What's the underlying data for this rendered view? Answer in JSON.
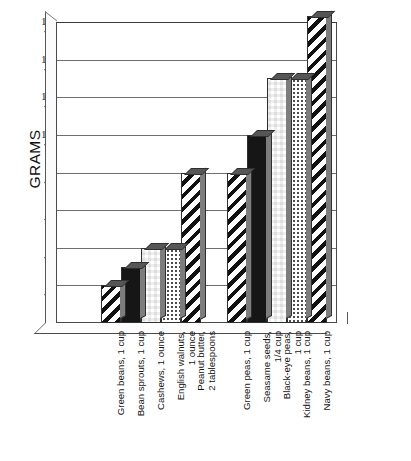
{
  "chart_data": {
    "type": "bar",
    "title": "",
    "xlabel": "",
    "ylabel": "GRAMS",
    "ylim": [
      0,
      16
    ],
    "yticks": [
      16,
      14,
      12,
      10,
      8,
      6,
      4,
      2,
      0
    ],
    "grid": true,
    "legend": "none",
    "categories": [
      "Green beans, 1 cup",
      "Bean sprouts, 1 cup",
      "Cashews, 1 ounce",
      "English walnuts, 1 ounce",
      "Peanut butter, 2 tablespoons",
      "Green peas, 1 cup",
      "Seasame seeds, 1/4 cup",
      "Black-eye peas, 1 cup",
      "Kidney beans, 1 cup",
      "Navy beans, 1 cup"
    ],
    "values": [
      2,
      3,
      4,
      4,
      8,
      8,
      10,
      13,
      13,
      16.3
    ],
    "series": [
      {
        "name": "Grams of protein",
        "values": [
          2,
          3,
          4,
          4,
          8,
          8,
          10,
          13,
          13,
          16.3
        ]
      }
    ]
  },
  "axis": {
    "y_title": "GRAMS",
    "ticks": [
      {
        "label": "16",
        "value": 16
      },
      {
        "label": "14",
        "value": 14
      },
      {
        "label": "12",
        "value": 12
      },
      {
        "label": "10",
        "value": 10
      },
      {
        "label": "8",
        "value": 8
      },
      {
        "label": "6",
        "value": 6
      },
      {
        "label": "4",
        "value": 4
      },
      {
        "label": "2",
        "value": 2
      },
      {
        "label": "0",
        "value": 0
      }
    ]
  },
  "bars": [
    {
      "label_line1": "Green beans, 1 cup",
      "label_line2": "",
      "value": 2,
      "pattern": "diagonal-stripes",
      "group": 1
    },
    {
      "label_line1": "Bean sprouts, 1 cup",
      "label_line2": "",
      "value": 3,
      "pattern": "solid-black",
      "group": 1
    },
    {
      "label_line1": "Cashews, 1 ounce",
      "label_line2": "",
      "value": 4,
      "pattern": "checkerboard",
      "group": 1
    },
    {
      "label_line1": "English walnuts,",
      "label_line2": "1 ounce",
      "value": 4,
      "pattern": "light-dots",
      "group": 1
    },
    {
      "label_line1": "Peanut butter,",
      "label_line2": "2 tablespoons",
      "value": 8,
      "pattern": "diagonal-stripes",
      "group": 1
    },
    {
      "label_line1": "Green peas, 1 cup",
      "label_line2": "",
      "value": 8,
      "pattern": "diagonal-stripes",
      "group": 2
    },
    {
      "label_line1": "Seasame seeds,",
      "label_line2": "1/4 cup",
      "value": 10,
      "pattern": "solid-black",
      "group": 2
    },
    {
      "label_line1": "Black-eye peas,",
      "label_line2": "1 cup",
      "value": 13,
      "pattern": "checkerboard",
      "group": 2
    },
    {
      "label_line1": "Kidney beans, 1 cup",
      "label_line2": "",
      "value": 13,
      "pattern": "light-dots",
      "group": 2
    },
    {
      "label_line1": "Navy beans, 1 cup",
      "label_line2": "",
      "value": 16.3,
      "pattern": "diagonal-stripes",
      "group": 2
    }
  ],
  "colors": {
    "background": "#ffffff",
    "axis_line": "#4a4a4a",
    "gridline": "#6f6f6f",
    "bar_outline": "#2f2f2f",
    "bar_top_cap": "#565656",
    "bar_side": "#7d7d7d",
    "text": "#151515"
  }
}
